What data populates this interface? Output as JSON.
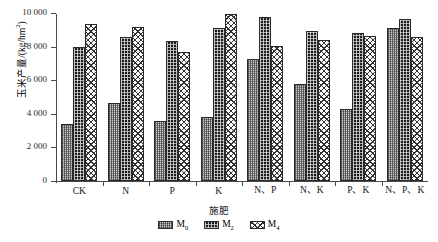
{
  "chart_data": {
    "type": "bar",
    "title": "",
    "xlabel": "施肥",
    "ylabel": "玉米产量/(kg/hm2)",
    "ylabel_parts": {
      "main": "玉米产量/(kg/hm",
      "sup": "2",
      "tail": ")"
    },
    "categories": [
      "CK",
      "N",
      "P",
      "K",
      "N、P",
      "N、K",
      "P、K",
      "N、P、K"
    ],
    "series": [
      {
        "name": "M0",
        "label_main": "M",
        "label_sub": "0",
        "values": [
          3370,
          4640,
          3600,
          3790,
          7260,
          5790,
          4270,
          9130
        ]
      },
      {
        "name": "M2",
        "label_main": "M",
        "label_sub": "2",
        "values": [
          7960,
          8550,
          8330,
          9090,
          9790,
          8930,
          8810,
          9640
        ]
      },
      {
        "name": "M4",
        "label_main": "M",
        "label_sub": "4",
        "values": [
          9340,
          9140,
          7690,
          9920,
          8060,
          8370,
          8610,
          8560
        ]
      }
    ],
    "ylim": [
      0,
      10000
    ],
    "yticks": [
      0,
      2000,
      4000,
      6000,
      8000,
      10000
    ],
    "ytick_labels": [
      "0",
      "2 000",
      "4 000",
      "6 000",
      "8 000",
      "10 000"
    ],
    "grid": false,
    "legend_position": "bottom"
  },
  "colors": {
    "axis": "#4a4a4a",
    "text": "#151515",
    "m0_fill": "#d2d2d2",
    "m2_fill": "#1d1d1d",
    "m4_fill": "#fbfbfb",
    "bar_outline": "#2a2a2a",
    "background": "#ffffff"
  }
}
